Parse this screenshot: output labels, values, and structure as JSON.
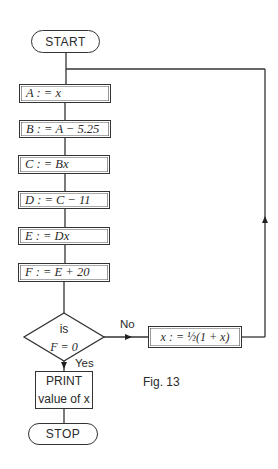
{
  "flowchart": {
    "start_label": "START",
    "steps": [
      {
        "text": "A : = x"
      },
      {
        "text": "B : = A − 5.25"
      },
      {
        "text": "C : = Bx"
      },
      {
        "text": "D : = C − 11"
      },
      {
        "text": "E : = Dx"
      },
      {
        "text": "F : = E + 20"
      }
    ],
    "decision": {
      "line1": "is",
      "line2": "F = 0"
    },
    "no_label": "No",
    "yes_label": "Yes",
    "loop_step": "x : = ½(1 + x)",
    "print": {
      "line1": "PRINT",
      "line2": "value of x"
    },
    "stop_label": "STOP",
    "caption": "Fig. 13"
  }
}
